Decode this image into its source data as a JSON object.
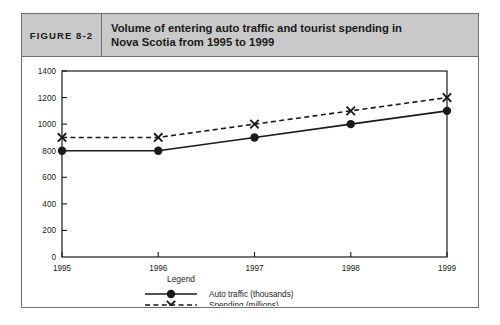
{
  "figure": {
    "label": "FIGURE 8-2",
    "title_line1": "Volume of entering auto traffic and tourist spending in",
    "title_line2": "Nova Scotia from 1995 to 1999",
    "header_bg": "#c9c9c9",
    "border_color": "#6e6e6e"
  },
  "chart_data": {
    "type": "line",
    "title": "Volume of entering auto traffic and tourist spending in Nova Scotia from 1995 to 1999",
    "categories": [
      "1995",
      "1996",
      "1997",
      "1998",
      "1999"
    ],
    "series": [
      {
        "name": "Auto traffic (thousands)",
        "values": [
          800,
          800,
          900,
          1000,
          1100
        ],
        "marker": "filled-circle",
        "line_style": "solid",
        "color": "#1a1a1a"
      },
      {
        "name": "Spending (millions)",
        "values": [
          900,
          900,
          1000,
          1100,
          1200
        ],
        "marker": "x-cross",
        "line_style": "dashed",
        "color": "#1a1a1a"
      }
    ],
    "xlabel": "",
    "ylabel": "",
    "ylim": [
      0,
      1400
    ],
    "ytick_step": 200,
    "yticks": [
      0,
      200,
      400,
      600,
      800,
      1000,
      1200,
      1400
    ],
    "ytick_labels": [
      "0",
      "200",
      "400",
      "600",
      "800",
      "1000",
      "1200",
      "1400"
    ],
    "grid": false,
    "legend_title": "Legend",
    "legend_position": "bottom-center"
  }
}
